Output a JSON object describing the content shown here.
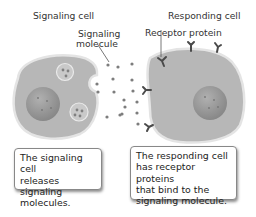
{
  "labels": {
    "signaling_cell": "Signaling cell",
    "responding_cell": "Responding cell",
    "signaling_molecule_line1": "Signaling",
    "signaling_molecule_line2": "molecule",
    "receptor_protein": "Receptor protein"
  },
  "captions": {
    "left": [
      "The signaling cell",
      "releases signaling",
      "molecules."
    ],
    "right": [
      "The responding cell",
      "has receptor proteins",
      "that bind to the",
      "signaling molecule."
    ]
  },
  "colors": {
    "cell_fill": "#b7b7b7",
    "cell_edge": "#d9d9d9",
    "nucleus": "#9a9a9a",
    "molecule": "#7d7d7d",
    "receptor": "#4a4a4a"
  }
}
